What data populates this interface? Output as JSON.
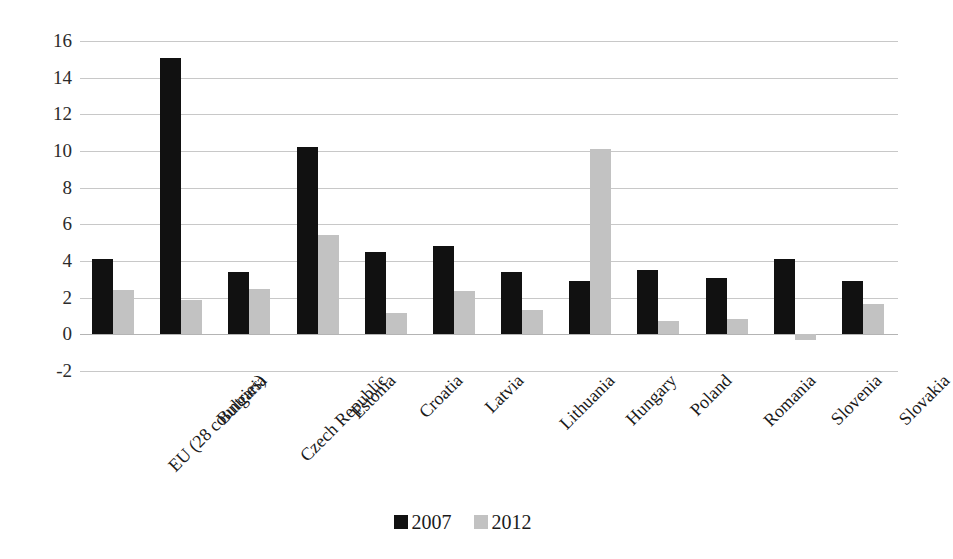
{
  "chart_data": {
    "type": "bar",
    "title": "",
    "subtitle": "",
    "xlabel": "",
    "ylabel": "",
    "ylim": [
      -2,
      16
    ],
    "ytick_step": 2,
    "yticks": [
      16,
      14,
      12,
      10,
      8,
      6,
      4,
      2,
      0,
      -2
    ],
    "ytick_labels": [
      "16",
      "14",
      "12",
      "10",
      "8",
      "6",
      "4",
      "2",
      "0",
      "-2"
    ],
    "grid": true,
    "legend_position": "bottom",
    "categories": [
      "EU (28 countries)",
      "Bulgaria",
      "Czech Republic",
      "Estonia",
      "Croatia",
      "Latvia",
      "Lithuania",
      "Hungary",
      "Poland",
      "Romania",
      "Slovenia",
      "Slovakia"
    ],
    "series": [
      {
        "name": "2007",
        "color": "#111111",
        "values": [
          4.1,
          15.1,
          3.4,
          10.2,
          4.5,
          4.8,
          3.4,
          2.9,
          3.5,
          3.1,
          4.1,
          2.9
        ]
      },
      {
        "name": "2012",
        "color": "#c2c2c2",
        "values": [
          2.4,
          1.85,
          2.5,
          5.4,
          1.15,
          2.35,
          1.35,
          10.1,
          0.75,
          0.85,
          -0.3,
          1.65
        ]
      }
    ]
  },
  "legend": {
    "items": [
      {
        "label": "2007",
        "color": "#111111"
      },
      {
        "label": "2012",
        "color": "#c2c2c2"
      }
    ]
  },
  "colors": {
    "series_2007": "#111111",
    "series_2012": "#c2c2c2",
    "gridline": "#c8c8c8",
    "background": "#ffffff",
    "text": "#1a1a1a"
  }
}
